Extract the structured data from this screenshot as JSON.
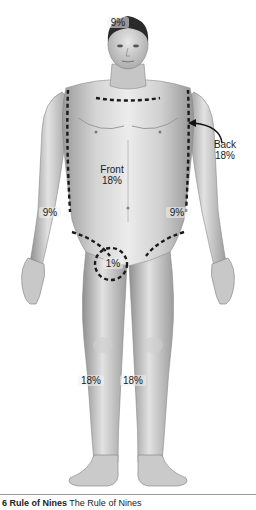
{
  "figure": {
    "regions": {
      "head": {
        "label": "9%"
      },
      "front_trunk": {
        "label": "Front",
        "value": "18%"
      },
      "back_trunk": {
        "label": "Back",
        "value": "18%"
      },
      "left_arm": {
        "label": "9%"
      },
      "right_arm": {
        "label": "9%"
      },
      "genitals": {
        "label": "1%"
      },
      "left_leg": {
        "label": "18%"
      },
      "right_leg": {
        "label": "18%"
      }
    },
    "colors": {
      "skin_light": "#e6e6e6",
      "skin_mid": "#bdbdbd",
      "skin_dark": "#8c8c8c",
      "hair": "#2a2a2a",
      "dashes": "#1a1a1a"
    }
  },
  "caption": {
    "prefix": "6 Rule of Nines",
    "text": "The Rule of Nines"
  }
}
